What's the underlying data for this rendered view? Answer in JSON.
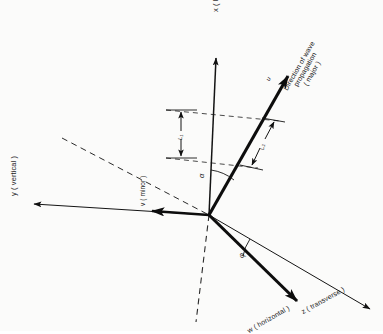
{
  "figure": {
    "background_color": "#fbfbfa",
    "ink_color": "#1a1a1a"
  },
  "axes": [
    {
      "id": "x-axis",
      "label": "x ( longitudinal )",
      "symbol": "x",
      "qualifier": "longitudinal",
      "style": "solid-arrow",
      "rotation_deg": -90,
      "from": [
        209,
        215
      ],
      "to": [
        216,
        55
      ]
    },
    {
      "id": "y-axis",
      "label": "y ( vertical )",
      "symbol": "y",
      "qualifier": "vertical",
      "style": "solid-arrow",
      "rotation_deg": -90,
      "from": [
        209,
        215
      ],
      "to": [
        30,
        203
      ]
    },
    {
      "id": "z-axis",
      "label": "z ( transverse )",
      "symbol": "z",
      "qualifier": "transverse",
      "style": "thin-line",
      "rotation_deg": -28,
      "from": [
        209,
        215
      ],
      "to": [
        372,
        310
      ]
    }
  ],
  "vectors": [
    {
      "id": "propagation-vector",
      "label": "Direction of wave propagation ( major )",
      "lines": [
        "Direction of wave",
        "propagation",
        "( major )"
      ],
      "symbol": "u",
      "qualifier": "major",
      "style": "thick-arrow",
      "from": [
        209,
        215
      ],
      "to": [
        291,
        72
      ]
    },
    {
      "id": "minor-vector",
      "label": "v ( minor )",
      "symbol": "v",
      "qualifier": "minor",
      "style": "thick-arrow",
      "rotation_deg": -90,
      "from": [
        209,
        215
      ],
      "to": [
        150,
        211
      ]
    },
    {
      "id": "horizontal-vector",
      "label": "w ( horizontal )",
      "symbol": "w",
      "qualifier": "horizontal",
      "style": "thick-arrow",
      "rotation_deg": -28,
      "from": [
        209,
        215
      ],
      "to": [
        300,
        305
      ]
    }
  ],
  "angles": [
    {
      "id": "alpha-angle",
      "symbol": "α",
      "between": [
        "x-axis",
        "propagation-vector"
      ],
      "vertex": [
        209,
        215
      ],
      "label_pos": [
        198,
        172
      ]
    },
    {
      "id": "phi-angle",
      "symbol": "φ",
      "between": [
        "z-axis",
        "horizontal-vector"
      ],
      "vertex": [
        209,
        215
      ],
      "label_pos": [
        240,
        253
      ]
    }
  ],
  "dimensions": [
    {
      "id": "l1-dimension",
      "symbol": "L₁",
      "orientation": "vertical",
      "from": [
        181,
        110
      ],
      "to": [
        181,
        158
      ]
    },
    {
      "id": "l2-dimension",
      "symbol": "L₂",
      "orientation": "slanted",
      "from": [
        278,
        120
      ],
      "to": [
        256,
        168
      ]
    }
  ],
  "construction_lines": [
    {
      "id": "dashed-diagonal",
      "style": "dashed",
      "from": [
        62,
        138
      ],
      "to": [
        209,
        215
      ]
    },
    {
      "id": "dashed-vertical",
      "style": "dashed",
      "from": [
        209,
        215
      ],
      "to": [
        196,
        322
      ]
    },
    {
      "id": "dashed-upper-tick",
      "style": "dashed",
      "from": [
        166,
        110
      ],
      "to": [
        278,
        121
      ]
    },
    {
      "id": "dashed-lower-tick",
      "style": "dashed",
      "from": [
        166,
        158
      ],
      "to": [
        256,
        168
      ]
    }
  ]
}
